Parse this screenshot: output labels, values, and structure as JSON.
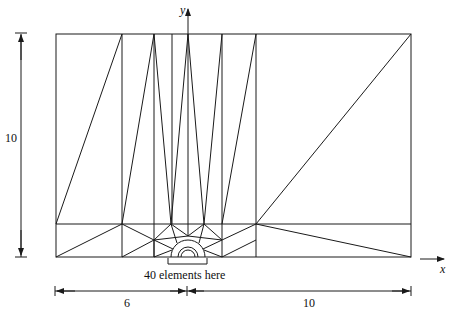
{
  "figure": {
    "type": "finite element mesh",
    "region": "rectangular domain with semicircular notch at origin",
    "axis_labels": {
      "x": "x",
      "y": "y"
    },
    "annotation": "40 elements here",
    "dimensions": {
      "height_label": "10",
      "left_width_label": "6",
      "right_width_label": "10"
    },
    "colors": {
      "line": "#1a1a1a",
      "background": "#ffffff"
    }
  }
}
